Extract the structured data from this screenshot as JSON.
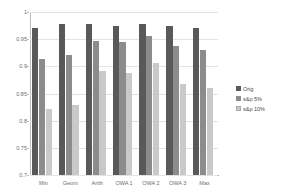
{
  "chart_data": {
    "type": "bar",
    "title": "",
    "xlabel": "",
    "ylabel": "",
    "ylim": [
      0.7,
      1.0
    ],
    "yticks": [
      "0.7",
      "0.75",
      "0.8",
      "0.85",
      "0.9",
      "0.95",
      "1"
    ],
    "ytick_values": [
      0.7,
      0.75,
      0.8,
      0.85,
      0.9,
      0.95,
      1.0
    ],
    "grid": true,
    "legend_position": "right",
    "categories": [
      "Min",
      "Geom",
      "Arith",
      "OWA 1",
      "OWA 2",
      "OWA 3",
      "Max"
    ],
    "series": [
      {
        "name": "Orig",
        "color": "#595959",
        "values": [
          0.97,
          0.978,
          0.978,
          0.975,
          0.978,
          0.975,
          0.971
        ]
      },
      {
        "name": "s&p 5%",
        "color": "#8c8c8c",
        "values": [
          0.914,
          0.921,
          0.947,
          0.944,
          0.955,
          0.937,
          0.93
        ]
      },
      {
        "name": "s&p 10%",
        "color": "#c9c9c9",
        "values": [
          0.822,
          0.829,
          0.892,
          0.888,
          0.906,
          0.867,
          0.861
        ]
      }
    ]
  },
  "legend": {
    "items": [
      {
        "label": "Orig"
      },
      {
        "label": "s&p 5%"
      },
      {
        "label": "s&p 10%"
      }
    ]
  },
  "colors": {
    "series_orig": "#595959",
    "series_sp5": "#8c8c8c",
    "series_sp10": "#c9c9c9",
    "gridline": "#e3e3e3",
    "axis": "#bdbdbd",
    "text": "#6e6e6e",
    "background": "#ffffff"
  }
}
